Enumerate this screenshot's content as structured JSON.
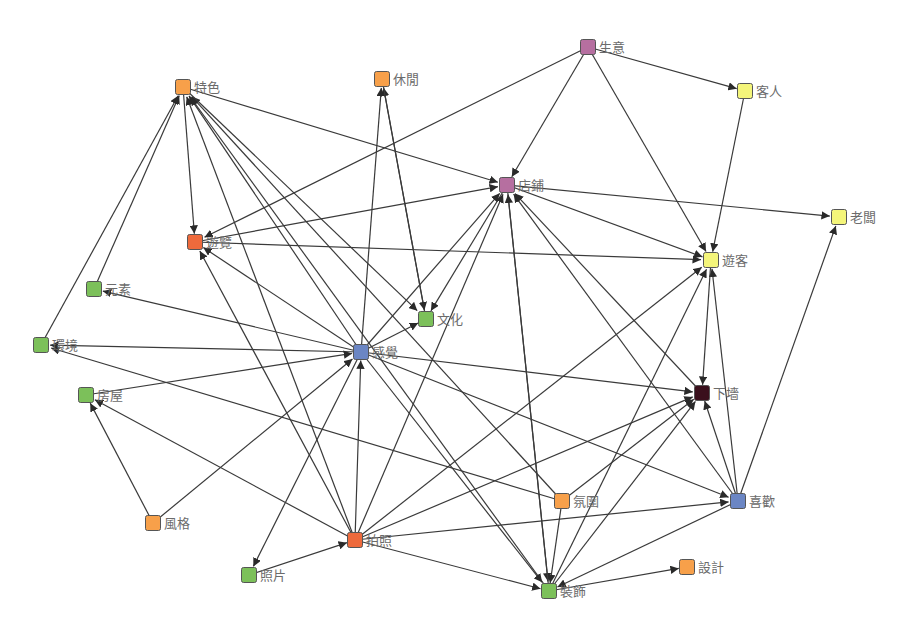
{
  "diagram": {
    "type": "directed-network",
    "colors": {
      "orange": "#f7a04a",
      "red": "#ee6a3c",
      "green": "#7cc05a",
      "blue": "#6b86c4",
      "purple": "#b66fa0",
      "yellow": "#f4f57a",
      "dark": "#3a0f1c",
      "edge": "#3a3a3a",
      "label": "#6b6b6b"
    },
    "nodes": [
      {
        "id": "tese",
        "label": "特色",
        "x": 183,
        "y": 87,
        "color": "orange"
      },
      {
        "id": "xiuxian",
        "label": "休閒",
        "x": 382,
        "y": 79,
        "color": "orange"
      },
      {
        "id": "shengyi",
        "label": "生意",
        "x": 588,
        "y": 47,
        "color": "purple"
      },
      {
        "id": "keren",
        "label": "客人",
        "x": 745,
        "y": 91,
        "color": "yellow"
      },
      {
        "id": "dianpu",
        "label": "店鋪",
        "x": 507,
        "y": 185,
        "color": "purple"
      },
      {
        "id": "laoban",
        "label": "老闆",
        "x": 839,
        "y": 217,
        "color": "yellow"
      },
      {
        "id": "youlan",
        "label": "遊覽",
        "x": 195,
        "y": 242,
        "color": "red"
      },
      {
        "id": "youke",
        "label": "遊客",
        "x": 711,
        "y": 260,
        "color": "yellow"
      },
      {
        "id": "yuansu",
        "label": "元素",
        "x": 94,
        "y": 289,
        "color": "green"
      },
      {
        "id": "wenhua",
        "label": "文化",
        "x": 426,
        "y": 319,
        "color": "green"
      },
      {
        "id": "huanjing",
        "label": "環境",
        "x": 41,
        "y": 345,
        "color": "green"
      },
      {
        "id": "ganjue",
        "label": "感覺",
        "x": 361,
        "y": 352,
        "color": "blue"
      },
      {
        "id": "fangwu",
        "label": "房屋",
        "x": 86,
        "y": 395,
        "color": "green"
      },
      {
        "id": "xiakan",
        "label": "下墻",
        "x": 702,
        "y": 393,
        "color": "dark"
      },
      {
        "id": "fenwei",
        "label": "氛圍",
        "x": 562,
        "y": 501,
        "color": "orange"
      },
      {
        "id": "xihuan",
        "label": "喜歡",
        "x": 738,
        "y": 501,
        "color": "blue"
      },
      {
        "id": "fengge",
        "label": "風格",
        "x": 153,
        "y": 523,
        "color": "orange"
      },
      {
        "id": "paizhao",
        "label": "拍照",
        "x": 355,
        "y": 540,
        "color": "red"
      },
      {
        "id": "zhaopian",
        "label": "照片",
        "x": 249,
        "y": 575,
        "color": "green"
      },
      {
        "id": "sheji",
        "label": "設計",
        "x": 687,
        "y": 567,
        "color": "orange"
      },
      {
        "id": "zhuangshi",
        "label": "裝飾",
        "x": 549,
        "y": 591,
        "color": "green"
      }
    ],
    "edges": [
      [
        "tese",
        "youlan"
      ],
      [
        "tese",
        "dianpu"
      ],
      [
        "yuansu",
        "tese"
      ],
      [
        "huanjing",
        "tese"
      ],
      [
        "ganjue",
        "tese"
      ],
      [
        "paizhao",
        "tese"
      ],
      [
        "fenwei",
        "tese"
      ],
      [
        "zhuangshi",
        "tese"
      ],
      [
        "ganjue",
        "wenhua"
      ],
      [
        "tese",
        "wenhua"
      ],
      [
        "shengyi",
        "keren"
      ],
      [
        "shengyi",
        "dianpu"
      ],
      [
        "shengyi",
        "youke"
      ],
      [
        "shengyi",
        "youlan"
      ],
      [
        "keren",
        "youke"
      ],
      [
        "dianpu",
        "laoban"
      ],
      [
        "dianpu",
        "youke"
      ],
      [
        "dianpu",
        "zhuangshi"
      ],
      [
        "dianpu",
        "wenhua"
      ],
      [
        "youlan",
        "dianpu"
      ],
      [
        "youlan",
        "youke"
      ],
      [
        "ganjue",
        "youlan"
      ],
      [
        "paizhao",
        "youlan"
      ],
      [
        "ganjue",
        "yuansu"
      ],
      [
        "ganjue",
        "huanjing"
      ],
      [
        "fangwu",
        "ganjue"
      ],
      [
        "ganjue",
        "dianpu"
      ],
      [
        "ganjue",
        "xiakan"
      ],
      [
        "ganjue",
        "xihuan"
      ],
      [
        "ganjue",
        "zhuangshi"
      ],
      [
        "ganjue",
        "zhaopian"
      ],
      [
        "ganjue",
        "xiuxian"
      ],
      [
        "wenhua",
        "xiuxian"
      ],
      [
        "xiuxian",
        "wenhua"
      ],
      [
        "paizhao",
        "ganjue"
      ],
      [
        "paizhao",
        "dianpu"
      ],
      [
        "paizhao",
        "youke"
      ],
      [
        "paizhao",
        "xiakan"
      ],
      [
        "paizhao",
        "xihuan"
      ],
      [
        "paizhao",
        "zhuangshi"
      ],
      [
        "paizhao",
        "fangwu"
      ],
      [
        "zhaopian",
        "paizhao"
      ],
      [
        "fengge",
        "fangwu"
      ],
      [
        "fengge",
        "ganjue"
      ],
      [
        "fenwei",
        "huanjing"
      ],
      [
        "fenwei",
        "zhuangshi"
      ],
      [
        "xihuan",
        "laoban"
      ],
      [
        "xihuan",
        "youke"
      ],
      [
        "xihuan",
        "xiakan"
      ],
      [
        "xihuan",
        "dianpu"
      ],
      [
        "xihuan",
        "zhuangshi"
      ],
      [
        "xiakan",
        "dianpu"
      ],
      [
        "zhuangshi",
        "xiakan"
      ],
      [
        "zhuangshi",
        "youke"
      ],
      [
        "zhuangshi",
        "sheji"
      ],
      [
        "zhuangshi",
        "dianpu"
      ],
      [
        "fenwei",
        "xiakan"
      ],
      [
        "youke",
        "xiakan"
      ]
    ]
  }
}
